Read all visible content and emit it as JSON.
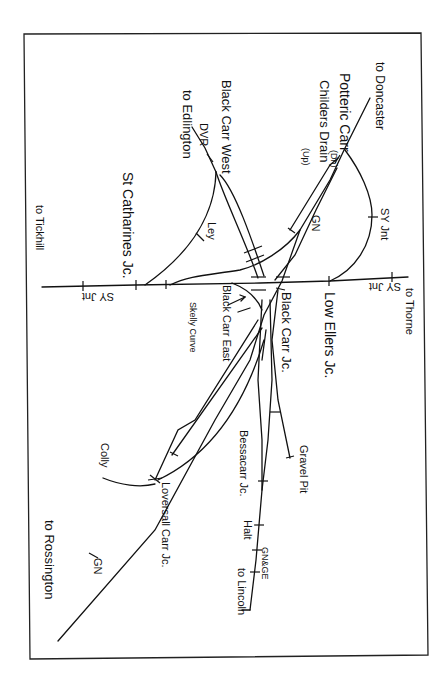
{
  "diagram": {
    "orientation": "rotated 90 degrees clockwise",
    "destinations": {
      "doncaster": "to Doncaster",
      "edlington": "to Edlington",
      "tickhill": "to Tickhill",
      "thorne": "to Thorne",
      "rossington": "to Rossington",
      "lincoln": "to Lincoln"
    },
    "junctions": {
      "potteric_carr": "Potteric Carr",
      "potteric_carr_suffix": "(Dn)",
      "childers_drain": "Childers Drain",
      "childers_drain_suffix": "(Up)",
      "black_carr_west": "Black Carr West",
      "st_catharines": "St Catharines Jc.",
      "low_ellers": "Low Ellers Jc.",
      "black_carr_east": "Black Carr East",
      "black_carr_jc": "Black Carr Jc.",
      "curve": "Skelly Curve",
      "bessacarr": "Bessacarr Jc.",
      "loversall_carr": "Loversall Carr Jc.",
      "gravel_pit": "Gravel Pit",
      "halt": "Halt",
      "colly": "Colly"
    },
    "line_codes": {
      "dvr": "DVR",
      "sy_jnt_1": "SY Jnt",
      "sy_jnt_2": "SY Jnt",
      "sy_jnt_3": "SY Jnt",
      "gn_1": "GN",
      "gn_2": "GN",
      "ley": "Ley",
      "gnge": "GN&GE"
    }
  }
}
